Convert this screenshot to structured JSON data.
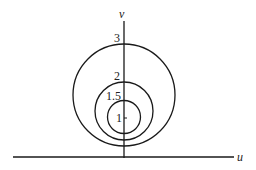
{
  "axes": {
    "horizontal_label": "u",
    "vertical_label": "v"
  },
  "circles": [
    {
      "label": "3",
      "cx": 124,
      "cy": 95,
      "r": 51
    },
    {
      "label": "2",
      "cx": 124,
      "cy": 111,
      "r": 29
    },
    {
      "label": "1.5",
      "cx": 124,
      "cy": 117,
      "r": 16.5
    }
  ],
  "point_label": "1",
  "colors": {
    "stroke": "#1a1a1a",
    "background": "#ffffff"
  }
}
